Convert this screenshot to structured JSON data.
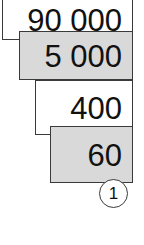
{
  "diagram": {
    "type": "place-value-expansion",
    "parts": [
      {
        "value": "90 000",
        "fill": "#ffffff"
      },
      {
        "value": "5 000",
        "fill": "#d9d9d9"
      },
      {
        "value": "400",
        "fill": "#ffffff"
      },
      {
        "value": "60",
        "fill": "#d9d9d9"
      }
    ],
    "marker": "1"
  }
}
